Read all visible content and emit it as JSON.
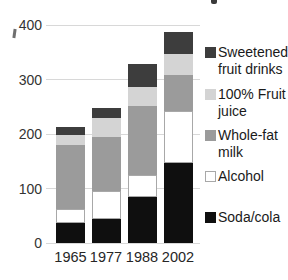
{
  "chart_data": {
    "type": "bar",
    "stacked": true,
    "title": "",
    "categories": [
      "1965",
      "1977",
      "1988",
      "2002"
    ],
    "series": [
      {
        "name": "Soda/cola",
        "color": "#0f0f0f",
        "values": [
          36,
          44,
          84,
          147
        ]
      },
      {
        "name": "Alcohol",
        "color": "#ffffff",
        "border": "#a8a8a8",
        "values": [
          26,
          51,
          41,
          96
        ]
      },
      {
        "name": "Whole-fat milk",
        "color": "#9b9b9b",
        "values": [
          117,
          100,
          127,
          65
        ]
      },
      {
        "name": "100% Fruit juice",
        "color": "#d4d4d4",
        "values": [
          20,
          35,
          35,
          39
        ]
      },
      {
        "name": "Sweetened fruit drinks",
        "color": "#3d3d3d",
        "values": [
          14,
          17,
          41,
          40
        ]
      }
    ],
    "totals": [
      213,
      247,
      327,
      387
    ],
    "xlabel": "",
    "ylabel": "",
    "ylim": [
      0,
      400
    ],
    "yticks": [
      "0",
      "100",
      "200",
      "300",
      "400"
    ],
    "grid": true,
    "legend_position": "right",
    "legend": [
      {
        "series": "Sweetened fruit drinks",
        "label_lines": [
          "Sweetened",
          "fruit drinks"
        ]
      },
      {
        "series": "100% Fruit juice",
        "label_lines": [
          "100% Fruit",
          "juice"
        ]
      },
      {
        "series": "Whole-fat milk",
        "label_lines": [
          "Whole-fat",
          "milk"
        ]
      },
      {
        "series": "Alcohol",
        "label_lines": [
          "Alcohol"
        ]
      },
      {
        "series": "Soda/cola",
        "label_lines": [
          "Soda/cola"
        ]
      }
    ]
  },
  "colors": {
    "gridline": "#d8d8d8",
    "axis_text": "#333333",
    "legend_text": "#1a1a1a",
    "background": "#ffffff"
  }
}
